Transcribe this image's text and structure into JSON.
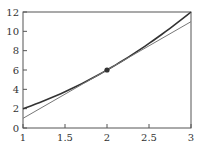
{
  "chart_data": {
    "type": "line",
    "title": "",
    "xlabel": "",
    "ylabel": "",
    "xlim": [
      1,
      3
    ],
    "ylim": [
      0,
      12
    ],
    "grid": false,
    "legend": null,
    "x_ticks": [
      "1",
      "1.5",
      "2",
      "2.5",
      "3"
    ],
    "y_ticks": [
      "0",
      "2",
      "4",
      "6",
      "8",
      "10",
      "12"
    ],
    "series": [
      {
        "name": "curve",
        "style": "thick dark line",
        "x": [
          1,
          1.25,
          1.5,
          1.75,
          2,
          2.25,
          2.5,
          2.75,
          3
        ],
        "y": [
          2,
          2.8125,
          3.75,
          4.8125,
          6,
          7.3125,
          8.75,
          10.3125,
          12
        ]
      },
      {
        "name": "tangent line",
        "style": "thin gray line",
        "x": [
          1,
          3
        ],
        "y": [
          1,
          11
        ]
      }
    ],
    "annotations": [
      {
        "type": "point",
        "x": 2,
        "y": 6,
        "label": ""
      }
    ]
  },
  "colors": {
    "axis": "#555555",
    "curve": "#333333",
    "tangent": "#777777",
    "point": "#333333"
  }
}
